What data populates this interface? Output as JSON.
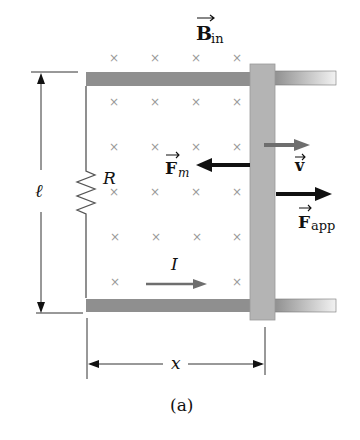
{
  "figure": {
    "caption": "(a)",
    "field_label": {
      "symbol": "B",
      "subscript": "in"
    },
    "resistor_label": "R",
    "length_label": "ℓ",
    "distance_label": "x",
    "current_label": "I",
    "magnetic_force_label": {
      "symbol": "F",
      "subscript": "m"
    },
    "velocity_label": "v",
    "applied_force_label": {
      "symbol": "F",
      "subscript": "app"
    },
    "field_marker": "×",
    "colors": {
      "rail": "#8f8f8f",
      "bar": "#b4b4b4",
      "arrow_dark": "#111111",
      "arrow_gray": "#6e6e6e",
      "field_marker": "#9a9a9a"
    }
  }
}
